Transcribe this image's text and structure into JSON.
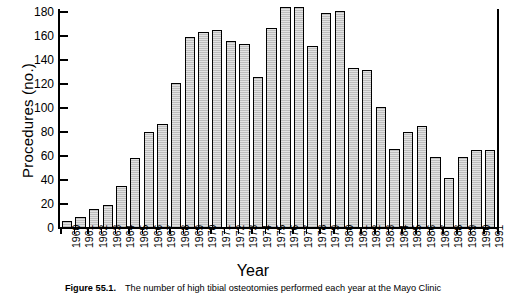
{
  "figure": {
    "caption_label": "Figure 55.1.",
    "caption_text": "The number of high tibial osteotomies performed each year at the Mayo Clinic"
  },
  "chart_data": {
    "type": "bar",
    "title": "",
    "xlabel": "Year",
    "ylabel": "Procedures (no.)",
    "ylim": [
      0,
      190
    ],
    "yticks": [
      0,
      20,
      40,
      60,
      80,
      100,
      120,
      140,
      160,
      180
    ],
    "ytick_labels": [
      "0",
      "20",
      "40",
      "60",
      "80",
      "100",
      "120",
      "140",
      "160",
      "180"
    ],
    "grid": false,
    "legend": null,
    "bar_fill": "#d2d2d2",
    "bar_edge": "#000000",
    "categories": [
      "1960",
      "1961",
      "1962",
      "1963",
      "1964",
      "1965",
      "1966",
      "1967",
      "1968",
      "1969",
      "1970",
      "1971",
      "1972",
      "1973",
      "1974",
      "1975",
      "1976",
      "1977",
      "1978",
      "1979",
      "1980",
      "1981",
      "1982",
      "1983",
      "1984",
      "1985",
      "1986",
      "1987",
      "1988",
      "1989",
      "1990",
      "1991"
    ],
    "values": [
      6,
      9,
      16,
      19,
      35,
      58,
      80,
      87,
      121,
      159,
      163,
      165,
      156,
      153,
      126,
      167,
      184,
      184,
      152,
      179,
      181,
      133,
      132,
      101,
      66,
      80,
      85,
      59,
      42,
      59,
      65,
      65
    ]
  }
}
